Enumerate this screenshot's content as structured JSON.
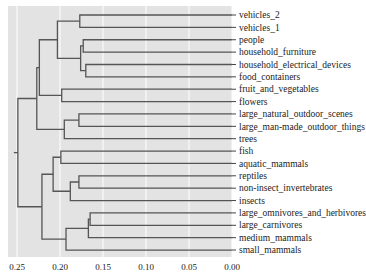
{
  "chart_data": {
    "type": "dendrogram",
    "title": "",
    "xlabel": "",
    "ylabel": "",
    "orientation": "left",
    "xlim": [
      0.25,
      0.0
    ],
    "x_ticks": [
      "0.25",
      "0.20",
      "0.15",
      "0.10",
      "0.05",
      "0.00"
    ],
    "x_tick_values": [
      0.25,
      0.2,
      0.15,
      0.1,
      0.05,
      0.0
    ],
    "grid": true,
    "background": "#e3e3e3",
    "grid_color": "#ffffff",
    "line_color": "#555555",
    "leaves": [
      "vehicles_2",
      "vehicles_1",
      "people",
      "household_furniture",
      "household_electrical_devices",
      "food_containers",
      "fruit_and_vegetables",
      "flowers",
      "large_natural_outdoor_scenes",
      "large_man-made_outdoor_things",
      "trees",
      "fish",
      "aquatic_mammals",
      "reptiles",
      "non-insect_invertebrates",
      "insects",
      "large_omnivores_and_herbivores",
      "large_carnivores",
      "medium_mammals",
      "small_mammals"
    ],
    "merges": [
      {
        "id": "m_vehicles",
        "children": [
          "L0",
          "L1"
        ],
        "height": 0.177
      },
      {
        "id": "m_people_furn",
        "children": [
          "L2",
          "L3"
        ],
        "height": 0.173
      },
      {
        "id": "m_elec_food",
        "children": [
          "L4",
          "L5"
        ],
        "height": 0.17
      },
      {
        "id": "m_household",
        "children": [
          "m_people_furn",
          "m_elec_food"
        ],
        "height": 0.176
      },
      {
        "id": "m_veh_house",
        "children": [
          "m_vehicles",
          "m_household"
        ],
        "height": 0.203
      },
      {
        "id": "m_plants",
        "children": [
          "L6",
          "L7"
        ],
        "height": 0.198
      },
      {
        "id": "m_upper_a",
        "children": [
          "m_veh_house",
          "m_plants"
        ],
        "height": 0.224
      },
      {
        "id": "m_outdoor",
        "children": [
          "L8",
          "L9"
        ],
        "height": 0.178
      },
      {
        "id": "m_outdoor_trees",
        "children": [
          "m_outdoor",
          "L10"
        ],
        "height": 0.195
      },
      {
        "id": "m_upper",
        "children": [
          "m_upper_a",
          "m_outdoor_trees"
        ],
        "height": 0.227
      },
      {
        "id": "m_aquatic",
        "children": [
          "L11",
          "L12"
        ],
        "height": 0.199
      },
      {
        "id": "m_rept_inv",
        "children": [
          "L13",
          "L14"
        ],
        "height": 0.178
      },
      {
        "id": "m_rept_ins",
        "children": [
          "m_rept_inv",
          "L15"
        ],
        "height": 0.188
      },
      {
        "id": "m_cold",
        "children": [
          "m_aquatic",
          "m_rept_ins"
        ],
        "height": 0.208
      },
      {
        "id": "m_large",
        "children": [
          "L16",
          "L17"
        ],
        "height": 0.165
      },
      {
        "id": "m_large_med",
        "children": [
          "m_large",
          "L18"
        ],
        "height": 0.167
      },
      {
        "id": "m_mammals",
        "children": [
          "m_large_med",
          "L19"
        ],
        "height": 0.193
      },
      {
        "id": "m_lower",
        "children": [
          "m_cold",
          "m_mammals"
        ],
        "height": 0.221
      },
      {
        "id": "m_root",
        "children": [
          "m_upper",
          "m_lower"
        ],
        "height": 0.249
      }
    ]
  }
}
